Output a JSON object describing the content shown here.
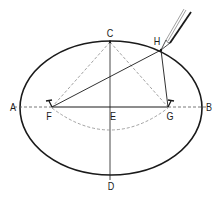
{
  "diagram": {
    "type": "ellipse-construction",
    "colors": {
      "stroke": "#1a1a1a",
      "dashed": "#7a7a7a",
      "background": "#ffffff"
    },
    "points": {
      "A": {
        "label": "A",
        "x": 20,
        "y": 107
      },
      "B": {
        "label": "B",
        "x": 202,
        "y": 107
      },
      "C": {
        "label": "C",
        "x": 110,
        "y": 42
      },
      "D": {
        "label": "D",
        "x": 110,
        "y": 177
      },
      "E": {
        "label": "E",
        "x": 110,
        "y": 107
      },
      "F": {
        "label": "F",
        "x": 52,
        "y": 107
      },
      "G": {
        "label": "G",
        "x": 168,
        "y": 107
      },
      "H": {
        "label": "H",
        "x": 161,
        "y": 50
      }
    },
    "labels": {
      "A": "A",
      "B": "B",
      "C": "C",
      "D": "D",
      "E": "E",
      "F": "F",
      "G": "G",
      "H": "H"
    },
    "ellipse": {
      "cx": 111,
      "cy": 108,
      "rx": 91,
      "ry": 67
    },
    "tools": {
      "pencil": "pencil-icon"
    }
  }
}
